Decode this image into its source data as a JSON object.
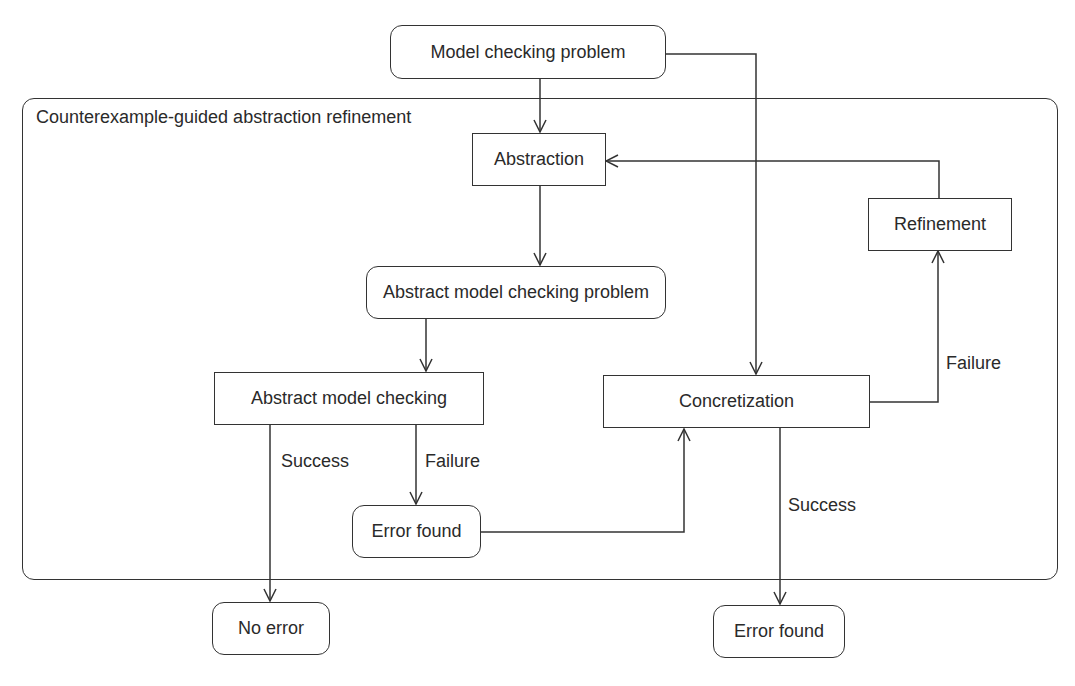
{
  "diagram": {
    "container": {
      "title": "Counterexample-guided abstraction refinement"
    },
    "nodes": {
      "model_checking_problem": "Model checking problem",
      "abstraction": "Abstraction",
      "refinement": "Refinement",
      "abstract_model_checking_problem": "Abstract model checking problem",
      "abstract_model_checking": "Abstract model checking",
      "concretization": "Concretization",
      "error_found_inner": "Error found",
      "no_error": "No error",
      "error_found_outer": "Error found"
    },
    "edge_labels": {
      "amc_success": "Success",
      "amc_failure": "Failure",
      "conc_failure": "Failure",
      "conc_success": "Success"
    },
    "edges": [
      {
        "from": "Model checking problem",
        "to": "Abstraction"
      },
      {
        "from": "Model checking problem",
        "to": "Concretization"
      },
      {
        "from": "Abstraction",
        "to": "Abstract model checking problem"
      },
      {
        "from": "Abstract model checking problem",
        "to": "Abstract model checking"
      },
      {
        "from": "Abstract model checking",
        "to": "No error",
        "label": "Success"
      },
      {
        "from": "Abstract model checking",
        "to": "Error found",
        "label": "Failure"
      },
      {
        "from": "Error found",
        "to": "Concretization"
      },
      {
        "from": "Concretization",
        "to": "Refinement",
        "label": "Failure"
      },
      {
        "from": "Refinement",
        "to": "Abstraction"
      },
      {
        "from": "Concretization",
        "to": "Error found",
        "label": "Success"
      }
    ]
  }
}
